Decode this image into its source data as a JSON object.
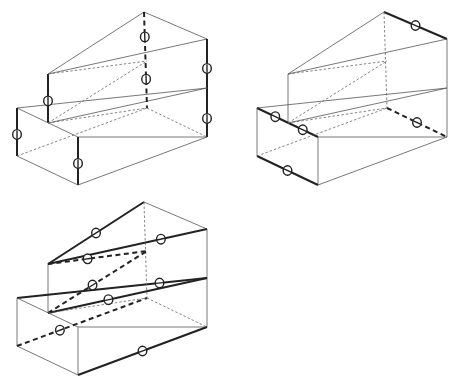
{
  "figure": {
    "panels": [
      {
        "id": "panel-1",
        "position": "top-left",
        "highlighted": "vertical edges",
        "marker_count": 6
      },
      {
        "id": "panel-2",
        "position": "top-right",
        "highlighted": "depth-direction edges",
        "marker_count": 5
      },
      {
        "id": "panel-3",
        "position": "bottom-left",
        "highlighted": "diagonal / width-direction edges",
        "marker_count": 8
      }
    ],
    "colors": {
      "line": "#555555",
      "highlight": "#222222",
      "background": "#ffffff"
    }
  }
}
